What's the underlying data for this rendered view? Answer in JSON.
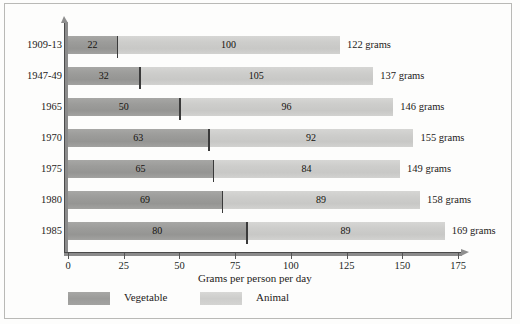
{
  "chart_data": {
    "type": "bar",
    "orientation": "horizontal",
    "stacked": true,
    "title": "",
    "xlabel": "Grams per person per day",
    "ylabel": "",
    "xlim": [
      0,
      175
    ],
    "xticks": [
      0,
      25,
      50,
      75,
      100,
      125,
      150,
      175
    ],
    "xtick_labels": [
      "0",
      "25",
      "50",
      "75",
      "100",
      "125",
      "150",
      "175"
    ],
    "grid": false,
    "legend_position": "bottom",
    "categories": [
      "1909-13",
      "1947-49",
      "1965",
      "1970",
      "1975",
      "1980",
      "1985"
    ],
    "series": [
      {
        "name": "Vegetable",
        "color": "#9c9c9a",
        "values": [
          22,
          32,
          50,
          63,
          65,
          69,
          80
        ]
      },
      {
        "name": "Animal",
        "color": "#cdcdcb",
        "values": [
          100,
          105,
          96,
          92,
          84,
          89,
          89
        ]
      }
    ],
    "totals": [
      122,
      137,
      146,
      155,
      149,
      158,
      169
    ],
    "total_unit": "grams",
    "total_labels": [
      "122 grams",
      "137 grams",
      "146 grams",
      "155 grams",
      "149 grams",
      "158 grams",
      "169 grams"
    ]
  },
  "legend": {
    "items": [
      {
        "label": "Vegetable",
        "color": "#9c9c9a"
      },
      {
        "label": "Animal",
        "color": "#cdcdcb"
      }
    ]
  },
  "axis": {
    "x_title": "Grams per person per day"
  }
}
